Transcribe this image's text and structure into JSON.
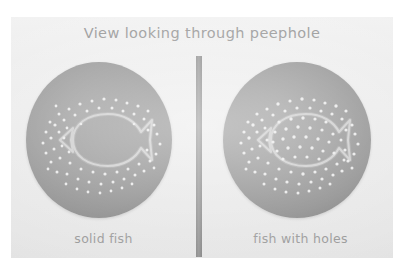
{
  "figure": {
    "title": "View looking through peephole",
    "background_color": "#ffffff",
    "photo_background_color": "#ededed",
    "disc_color": "#939393",
    "hole_color": "#e9e9e9",
    "divider_color": "#8e8e8e",
    "text_color": "#9a9a9a"
  },
  "panels": [
    {
      "id": "solid-fish",
      "caption": "solid fish",
      "description": "Gray disc with a fish outline; pinholes surround the fish but none inside the fish body",
      "holes_inside_fish": false
    },
    {
      "id": "fish-with-holes",
      "caption": "fish with holes",
      "description": "Gray disc with a fish outline; pinholes cover the whole disc including inside the fish body",
      "holes_inside_fish": true
    }
  ],
  "divider": {
    "name": "vertical-separator"
  }
}
